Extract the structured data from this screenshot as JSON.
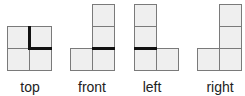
{
  "diagram": {
    "title": "",
    "colors": {
      "cell_fill": "#efefef",
      "cell_border": "#7a7a7a",
      "thick_edge": "#111111",
      "text": "#222222"
    },
    "views": [
      {
        "id": "top",
        "label": "top",
        "cells": [
          [
            0,
            0
          ],
          [
            1,
            0
          ],
          [
            0,
            1
          ],
          [
            1,
            1
          ]
        ],
        "thick_edges": [
          "vertical center upper half",
          "horizontal center right half"
        ]
      },
      {
        "id": "front",
        "label": "front",
        "cells": [
          [
            1,
            0
          ],
          [
            1,
            1
          ],
          [
            0,
            2
          ],
          [
            1,
            2
          ]
        ],
        "thick_edges": [
          "horizontal between middle and bottom of right column"
        ]
      },
      {
        "id": "left",
        "label": "left",
        "cells": [
          [
            0,
            0
          ],
          [
            0,
            1
          ],
          [
            0,
            2
          ],
          [
            1,
            2
          ]
        ],
        "thick_edges": [
          "horizontal between middle and bottom of left column"
        ]
      },
      {
        "id": "right",
        "label": "right",
        "cells": [
          [
            1,
            0
          ],
          [
            1,
            1
          ],
          [
            0,
            2
          ],
          [
            1,
            2
          ]
        ],
        "thick_edges": []
      }
    ]
  }
}
